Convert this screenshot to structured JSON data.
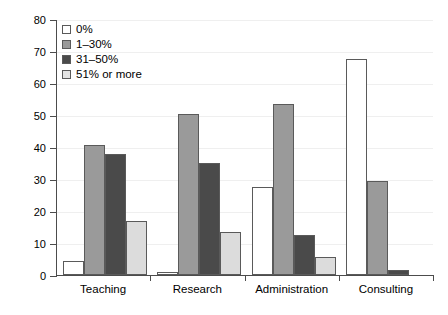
{
  "chart_data": {
    "type": "bar",
    "title": "",
    "xlabel": "",
    "ylabel": "Percent valid answers",
    "ylim": [
      0,
      80
    ],
    "ytick_values": [
      0,
      10,
      20,
      30,
      40,
      50,
      60,
      70,
      80
    ],
    "ytick_labels": [
      "0",
      "10",
      "20",
      "30",
      "40",
      "50",
      "60",
      "70",
      "80"
    ],
    "grid": true,
    "legend_position": "top-left",
    "categories": [
      "Teaching",
      "Research",
      "Administration",
      "Consulting"
    ],
    "series": [
      {
        "name": "0%",
        "color": "#ffffff",
        "values": [
          4.5,
          1.0,
          27.5,
          67.5
        ]
      },
      {
        "name": "1–30%",
        "color": "#9a9a9a",
        "values": [
          40.5,
          50.2,
          53.5,
          29.5
        ]
      },
      {
        "name": "31–50%",
        "color": "#4a4a4a",
        "values": [
          37.7,
          35.0,
          12.5,
          1.5
        ]
      },
      {
        "name": "51% or more",
        "color": "#dcdcdc",
        "values": [
          17.0,
          13.5,
          5.5,
          0.0
        ]
      }
    ]
  },
  "legend": {
    "items": [
      {
        "label": "0%"
      },
      {
        "label": "1–30%"
      },
      {
        "label": "31–50%"
      },
      {
        "label": "51% or more"
      }
    ]
  }
}
